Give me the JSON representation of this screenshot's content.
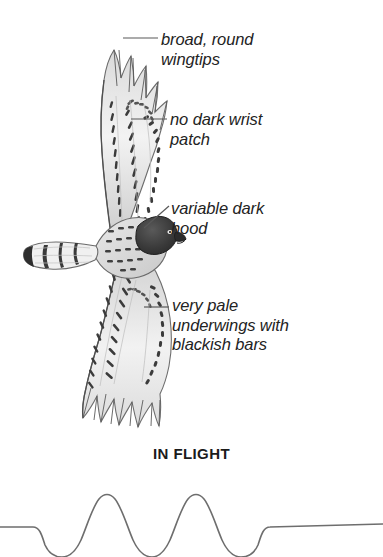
{
  "plate": {
    "subject": "broad-winged hawk underwing flight illustration",
    "caption": "IN FLIGHT",
    "background_color": "#ffffff",
    "ink_color": "#232323",
    "line_color": "#6e6e6e"
  },
  "annotations": [
    {
      "id": "wingtips",
      "text": "broad, round\nwingtips",
      "leader": "horizontal",
      "points_to": "upper-wingtip"
    },
    {
      "id": "wrist",
      "text": "no dark wrist\npatch",
      "leader": "horizontal",
      "points_to": "upper-wing-wrist"
    },
    {
      "id": "hood",
      "text": "variable dark\nhood",
      "leader": "diagonal",
      "points_to": "head"
    },
    {
      "id": "underwings",
      "text": "very pale\nunderwings with\nblackish bars",
      "leader": "horizontal",
      "points_to": "lower-wing"
    }
  ],
  "flight_profile": {
    "label": "undulating flight path",
    "baseline_y": 527,
    "crest_y": 494,
    "trough_y": 556,
    "stroke_color": "#6e6e6e"
  }
}
